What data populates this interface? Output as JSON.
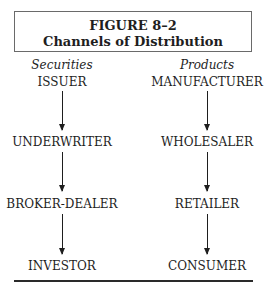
{
  "figure": {
    "label": "FIGURE 8–2",
    "title": "Channels of Distribution"
  },
  "columns": [
    {
      "heading": "Securities",
      "nodes": [
        "ISSUER",
        "UNDERWRITER",
        "BROKER-DEALER",
        "INVESTOR"
      ]
    },
    {
      "heading": "Products",
      "nodes": [
        "MANUFACTURER",
        "WHOLESALER",
        "RETAILER",
        "CONSUMER"
      ]
    }
  ],
  "edges": [
    {
      "from": "ISSUER",
      "to": "UNDERWRITER"
    },
    {
      "from": "UNDERWRITER",
      "to": "BROKER-DEALER"
    },
    {
      "from": "BROKER-DEALER",
      "to": "INVESTOR"
    },
    {
      "from": "MANUFACTURER",
      "to": "WHOLESALER"
    },
    {
      "from": "WHOLESALER",
      "to": "RETAILER"
    },
    {
      "from": "RETAILER",
      "to": "CONSUMER"
    }
  ]
}
